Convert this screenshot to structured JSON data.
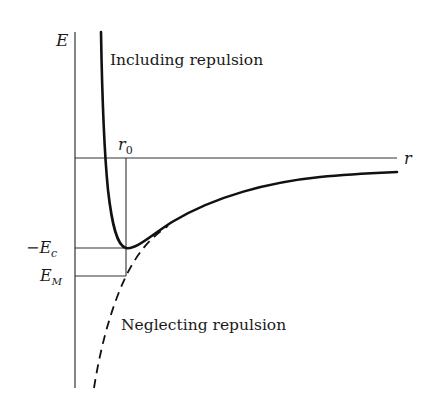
{
  "diagram": {
    "axes": {
      "y_label": "E",
      "x_label": "r"
    },
    "markers": {
      "r0_label": "r",
      "r0_sub": "0",
      "ec_label": "−E",
      "ec_sub": "c",
      "em_label": "E",
      "em_sub": "M"
    },
    "curves": {
      "including": "Including repulsion",
      "neglecting": "Neglecting repulsion"
    },
    "colors": {
      "line": "#1a1a1a",
      "background": "#ffffff"
    }
  }
}
